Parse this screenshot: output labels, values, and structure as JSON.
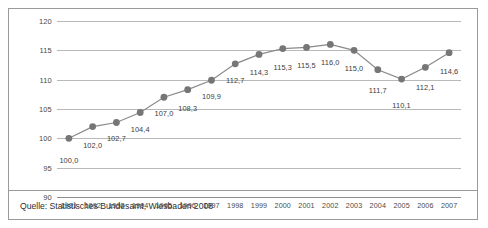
{
  "figure": {
    "source_note": "Quelle: Statistisches Bundesamt, Wiesbaden 2008",
    "colors": {
      "line": "#8a8a8a",
      "marker": "#767676",
      "grid": "#b9b9b9",
      "border": "#9a9a9a",
      "text": "#3d3d3d",
      "background": "#ffffff"
    }
  },
  "chart_data": {
    "type": "line",
    "title": "",
    "subtitle": "",
    "xlabel": "",
    "ylabel": "",
    "grid": "horizontal",
    "legend": "none",
    "decimal_separator": ",",
    "xlim": [
      "1991",
      "2007"
    ],
    "ylim": [
      90,
      120
    ],
    "ytick_labels": [
      "120",
      "115",
      "110",
      "105",
      "100",
      "95",
      "90"
    ],
    "yticks": [
      120,
      115,
      110,
      105,
      100,
      95,
      90
    ],
    "categories": [
      "1991",
      "1992",
      "1993",
      "1994",
      "1995",
      "1996",
      "1997",
      "1998",
      "1999",
      "2000",
      "2001",
      "2002",
      "2003",
      "2004",
      "2005",
      "2006",
      "2007"
    ],
    "values": [
      100.0,
      102.0,
      102.7,
      104.4,
      107.0,
      108.3,
      109.9,
      112.7,
      114.3,
      115.3,
      115.5,
      116.0,
      115.0,
      111.7,
      110.1,
      112.1,
      114.6
    ],
    "point_labels": [
      "100,0",
      "102,0",
      "102,7",
      "104,4",
      "107,0",
      "108,3",
      "109,9",
      "112,7",
      "114,3",
      "115,3",
      "115,5",
      "116,0",
      "115,0",
      "111,7",
      "110,1",
      "112,1",
      "114,6"
    ],
    "label_offsets": [
      18,
      14,
      12,
      12,
      12,
      14,
      12,
      12,
      14,
      14,
      14,
      14,
      14,
      16,
      22,
      16,
      14
    ]
  }
}
